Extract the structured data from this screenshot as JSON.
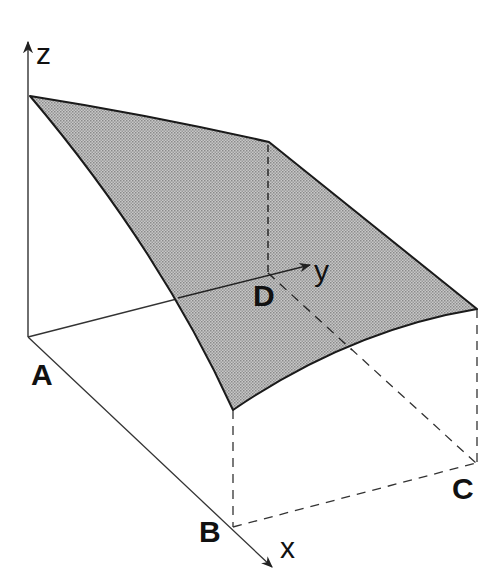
{
  "figure": {
    "fill_color": "#b4b4b4",
    "edge_color": "#1a1a1a",
    "axes": {
      "x": {
        "label": "x"
      },
      "y": {
        "label": "y"
      },
      "z": {
        "label": "z"
      }
    },
    "points": {
      "A": {
        "label": "A"
      },
      "B": {
        "label": "B"
      },
      "C": {
        "label": "C"
      },
      "D": {
        "label": "D"
      }
    }
  }
}
